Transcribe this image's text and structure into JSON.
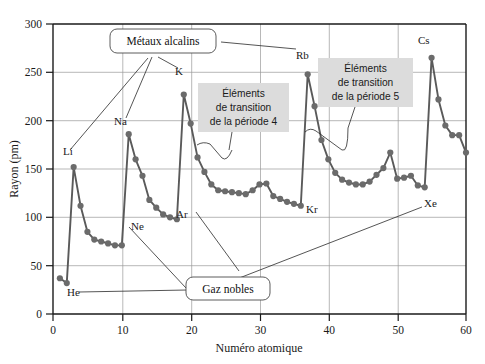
{
  "figure": {
    "name": "atomic-radius-vs-atomic-number",
    "x_label": "Numéro atomique",
    "y_label": "Rayon (pm)"
  },
  "chart_data": {
    "type": "line",
    "title": "",
    "xlabel": "Numéro atomique",
    "ylabel": "Rayon (pm)",
    "xlim": [
      0,
      60
    ],
    "ylim": [
      0,
      300
    ],
    "xticks": [
      0,
      10,
      20,
      30,
      40,
      50,
      60
    ],
    "yticks": [
      0,
      50,
      100,
      150,
      200,
      250,
      300
    ],
    "grid": true,
    "legend": "none",
    "series": [
      {
        "name": "Rayon atomique",
        "x": [
          1,
          2,
          3,
          4,
          5,
          6,
          7,
          8,
          9,
          10,
          11,
          12,
          13,
          14,
          15,
          16,
          17,
          18,
          19,
          20,
          21,
          22,
          23,
          24,
          25,
          26,
          27,
          28,
          29,
          30,
          31,
          32,
          33,
          34,
          35,
          36,
          37,
          38,
          39,
          40,
          41,
          42,
          43,
          44,
          45,
          46,
          47,
          48,
          49,
          50,
          51,
          52,
          53,
          54,
          55,
          56,
          57,
          58,
          59,
          60
        ],
        "values": [
          37,
          32,
          152,
          112,
          85,
          77,
          75,
          73,
          71,
          71,
          186,
          160,
          143,
          118,
          110,
          103,
          100,
          98,
          227,
          197,
          162,
          147,
          134,
          128,
          127,
          126,
          125,
          124,
          128,
          134,
          135,
          122,
          119,
          116,
          114,
          112,
          248,
          215,
          180,
          160,
          146,
          139,
          136,
          134,
          134,
          137,
          144,
          151,
          167,
          140,
          141,
          143,
          133,
          131,
          265,
          222,
          195,
          185,
          185,
          167
        ]
      }
    ],
    "point_labels": [
      {
        "element": "H",
        "z": 1,
        "value": 37,
        "shown": false
      },
      {
        "element": "He",
        "z": 2,
        "value": 32,
        "shown": true
      },
      {
        "element": "Li",
        "z": 3,
        "value": 152,
        "shown": true
      },
      {
        "element": "Ne",
        "z": 10,
        "value": 71,
        "shown": true
      },
      {
        "element": "Na",
        "z": 11,
        "value": 186,
        "shown": true
      },
      {
        "element": "Ar",
        "z": 18,
        "value": 98,
        "shown": true
      },
      {
        "element": "K",
        "z": 19,
        "value": 227,
        "shown": true
      },
      {
        "element": "Kr",
        "z": 36,
        "value": 112,
        "shown": true
      },
      {
        "element": "Rb",
        "z": 37,
        "value": 248,
        "shown": true
      },
      {
        "element": "Xe",
        "z": 54,
        "value": 131,
        "shown": true
      },
      {
        "element": "Cs",
        "z": 55,
        "value": 265,
        "shown": true
      }
    ],
    "annotations": [
      {
        "id": "metaux-alcalins",
        "text": "Métaux alcalins",
        "style": "rounded-box-white",
        "points_to": [
          "Li",
          "Na",
          "K",
          "Rb",
          "Cs"
        ]
      },
      {
        "id": "gaz-nobles",
        "text": "Gaz nobles",
        "style": "rounded-box-white",
        "points_to": [
          "He",
          "Ne",
          "Ar",
          "Kr",
          "Xe"
        ]
      },
      {
        "id": "transition-p4",
        "text_lines": [
          "Éléments",
          "de transition",
          "de la période 4"
        ],
        "style": "grey-box",
        "brace_range": [
          21,
          30
        ]
      },
      {
        "id": "transition-p5",
        "text_lines": [
          "Éléments",
          "de transition",
          "de la période 5"
        ],
        "style": "grey-box",
        "brace_range": [
          39,
          48
        ]
      }
    ]
  },
  "labels": {
    "H": "H",
    "He": "He",
    "Li": "Li",
    "Ne": "Ne",
    "Na": "Na",
    "Ar": "Ar",
    "K": "K",
    "Kr": "Kr",
    "Rb": "Rb",
    "Xe": "Xe",
    "Cs": "Cs"
  },
  "callouts": {
    "alkali": "Métaux alcalins",
    "noble": "Gaz nobles",
    "transition4": {
      "l1": "Éléments",
      "l2": "de transition",
      "l3": "de la période 4"
    },
    "transition5": {
      "l1": "Éléments",
      "l2": "de transition",
      "l3": "de la période 5"
    }
  },
  "ticks": {
    "x": [
      "0",
      "10",
      "20",
      "30",
      "40",
      "50",
      "60"
    ],
    "y": [
      "0",
      "50",
      "100",
      "150",
      "200",
      "250",
      "300"
    ]
  },
  "colors": {
    "line": "#5a5a5a",
    "point": "#6b6b6b",
    "axis": "#1a1a1a",
    "grid": "#9a9a9a",
    "greybox": "#dcdcdc",
    "background": "#ffffff"
  }
}
